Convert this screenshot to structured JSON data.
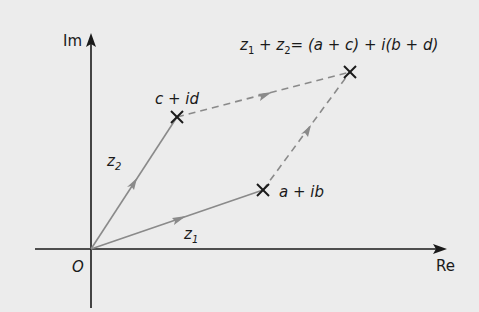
{
  "diagram": {
    "axes": {
      "x_label": "Re",
      "y_label": "Im",
      "origin_label": "O"
    },
    "points": {
      "z1_point": "a + ib",
      "z2_point": "c + id",
      "sum_point": "z1 + z2 = (a + c) + i(b + d)"
    },
    "vectors": {
      "z1": {
        "name": "z",
        "sub": "1"
      },
      "z2": {
        "name": "z",
        "sub": "2"
      }
    },
    "sum_label": {
      "z": "z",
      "sub1": "1",
      "plus": " + ",
      "sub2": "2",
      "rhs": "= (a + c) + i(b + d)"
    },
    "colors": {
      "background": "#ececec",
      "axis": "#1a1a1a",
      "vector": "#8a8a8a",
      "marker": "#1a1a1a"
    }
  }
}
